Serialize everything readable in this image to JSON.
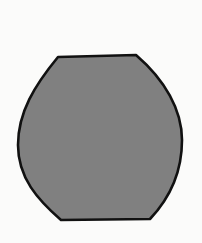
{
  "scene": {
    "background_color": "#fbfbfa",
    "shape": {
      "kind": "barrel-shape",
      "fill_color": "#808080",
      "stroke_color": "#111111",
      "stroke_width": 2.6,
      "path": "M58,57 L136,55 C165,80 182,110 182,140 C182,175 168,200 150,219 L61,220 C38,200 18,178 18,145 C18,112 35,85 58,57 Z"
    }
  }
}
